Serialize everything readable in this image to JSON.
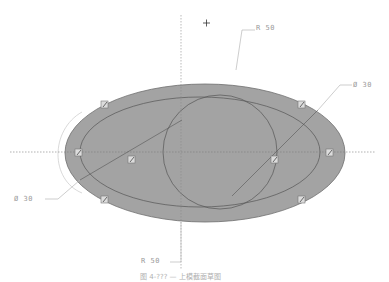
{
  "drawing": {
    "colors": {
      "shape_fill": "#a3a3a3",
      "shape_stroke": "#6f6f6f",
      "construction_line": "#555555",
      "centerline": "#8c8c8c",
      "leader_line": "#b8b8b8",
      "handle_fill": "#dcdcdc",
      "label_text": "#9a9a9a"
    },
    "crosshair_cursor": "+",
    "handles": [
      {
        "id": "handle-top-left",
        "glyph": "⬚"
      },
      {
        "id": "handle-top-right",
        "glyph": "⬚"
      },
      {
        "id": "handle-left",
        "glyph": "⬚"
      },
      {
        "id": "handle-center-left",
        "glyph": "⬚"
      },
      {
        "id": "handle-center-right",
        "glyph": "⬚"
      },
      {
        "id": "handle-right",
        "glyph": "⬚"
      },
      {
        "id": "handle-bottom-left",
        "glyph": "⬚"
      },
      {
        "id": "handle-bottom-right",
        "glyph": "⬚"
      }
    ]
  },
  "dimensions": {
    "top_radius": "R 50",
    "bottom_radius": "R 50",
    "right_diameter": "Ø 30",
    "left_diameter": "Ø 30"
  },
  "caption": "图 4-??? — 上模截面草图"
}
